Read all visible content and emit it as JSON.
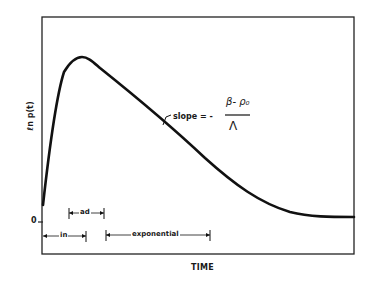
{
  "diagram": {
    "y_axis_label": "ℓn p(t)",
    "x_axis_label": "TIME",
    "zero_tick_label": "0",
    "annotation": {
      "slope_label": "slope = -",
      "fraction_numerator": "β- ρ₀",
      "fraction_denominator": "Λ"
    },
    "intervals": [
      {
        "label": "ad",
        "start_x": 69,
        "end_x": 104
      },
      {
        "label": "in",
        "start_x": 43,
        "end_x": 86
      },
      {
        "label": "exponential",
        "start_x": 106,
        "end_x": 210
      }
    ],
    "curve_description": "ln p(t) rises steeply from initial value to a peak, then decays linearly (exponential phase) and levels off to a constant plateau"
  }
}
